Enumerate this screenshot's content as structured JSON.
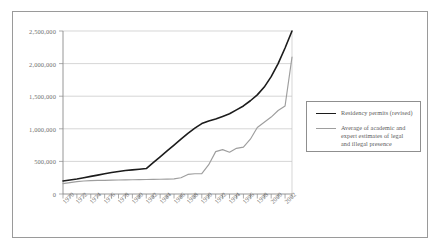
{
  "chart_data": {
    "type": "line",
    "title": "",
    "xlabel": "",
    "ylabel": "",
    "xlim": [
      1970,
      2003
    ],
    "ylim": [
      0,
      2500000
    ],
    "grid": true,
    "legend_position": "right",
    "y_ticks": [
      "0",
      "500,000",
      "1,000,000",
      "1,500,000",
      "2,000,000",
      "2,500,000"
    ],
    "y_tick_values": [
      0,
      500000,
      1000000,
      1500000,
      2000000,
      2500000
    ],
    "x_ticks": [
      "1970",
      "1972",
      "1974",
      "1976",
      "1978",
      "1980",
      "1982",
      "1984",
      "1986",
      "1988",
      "1990",
      "1992",
      "1994",
      "1996",
      "1998",
      "2000",
      "2002"
    ],
    "x": [
      1970,
      1971,
      1972,
      1973,
      1974,
      1975,
      1976,
      1977,
      1978,
      1979,
      1980,
      1981,
      1982,
      1983,
      1984,
      1985,
      1986,
      1987,
      1988,
      1989,
      1990,
      1991,
      1992,
      1993,
      1994,
      1995,
      1996,
      1997,
      1998,
      1999,
      2000,
      2001,
      2002,
      2003
    ],
    "series": [
      {
        "name": "Residency permits (revised)",
        "color": "#1c1c1c",
        "values": [
          200000,
          215000,
          230000,
          250000,
          270000,
          290000,
          310000,
          330000,
          345000,
          360000,
          370000,
          380000,
          390000,
          480000,
          570000,
          660000,
          750000,
          840000,
          930000,
          1010000,
          1080000,
          1120000,
          1150000,
          1190000,
          1230000,
          1290000,
          1350000,
          1430000,
          1520000,
          1640000,
          1800000,
          2000000,
          2240000,
          2500000
        ]
      },
      {
        "name": "Average of academic and expert estimates of legal and illegal presence",
        "color": "#9e9e9e",
        "values": [
          160000,
          175000,
          190000,
          200000,
          205000,
          208000,
          210000,
          212000,
          214000,
          216000,
          218000,
          220000,
          222000,
          224000,
          226000,
          228000,
          232000,
          250000,
          300000,
          310000,
          312000,
          450000,
          650000,
          680000,
          640000,
          700000,
          720000,
          840000,
          1020000,
          1100000,
          1180000,
          1280000,
          1350000,
          2100000
        ]
      }
    ]
  },
  "legend": {
    "items": [
      {
        "label": "Residency permits (revised)",
        "swatch": "dark"
      },
      {
        "label": "Average of academic and",
        "label_line2": "expert estimates of legal",
        "label_line3": "and illegal presence",
        "swatch": "light"
      }
    ]
  }
}
